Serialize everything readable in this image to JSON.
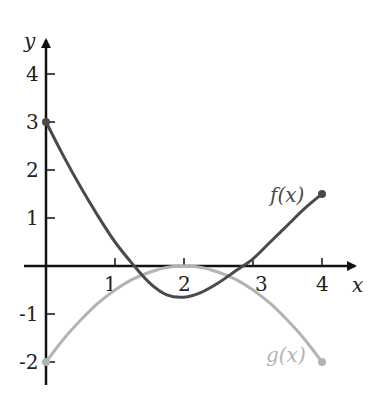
{
  "chart_data": {
    "type": "line",
    "title": "",
    "xlabel": "x",
    "ylabel": "y",
    "xlim": [
      0,
      4
    ],
    "ylim": [
      -2,
      4
    ],
    "x_ticks": [
      "1",
      "2",
      "3",
      "4"
    ],
    "y_ticks": [
      "4",
      "3",
      "2",
      "1",
      "-1",
      "-2"
    ],
    "grid": false,
    "series": [
      {
        "name": "f(x)",
        "color": "#4a4a4a",
        "x": [
          0,
          0.25,
          0.5,
          0.75,
          1,
          1.25,
          1.5,
          1.75,
          2,
          2.25,
          2.5,
          2.75,
          3,
          3.25,
          3.5,
          3.75,
          4
        ],
        "y": [
          3,
          2.3,
          1.65,
          1.05,
          0.5,
          0.05,
          -0.35,
          -0.6,
          -0.65,
          -0.55,
          -0.35,
          -0.1,
          0.15,
          0.5,
          0.85,
          1.2,
          1.5
        ]
      },
      {
        "name": "g(x)",
        "color": "#b3b3b3",
        "x": [
          0,
          0.25,
          0.5,
          0.75,
          1,
          1.25,
          1.5,
          1.75,
          2,
          2.25,
          2.5,
          2.75,
          3,
          3.25,
          3.5,
          3.75,
          4
        ],
        "y": [
          -2,
          -1.53,
          -1.13,
          -0.78,
          -0.5,
          -0.28,
          -0.13,
          -0.03,
          0,
          -0.03,
          -0.13,
          -0.28,
          -0.5,
          -0.78,
          -1.13,
          -1.53,
          -2
        ]
      }
    ],
    "annotations": [
      {
        "text": "f(x)",
        "x": 3.5,
        "y": 1.7
      },
      {
        "text": "g(x)",
        "x": 3.4,
        "y": -1.9
      }
    ]
  },
  "labels": {
    "x_axis": "x",
    "y_axis": "y",
    "f_label": "f(x)",
    "g_label": "g(x)",
    "x1": "1",
    "x2": "2",
    "x3": "3",
    "x4": "4",
    "y4": "4",
    "y3": "3",
    "y2": "2",
    "y1": "1",
    "ym1": "-1",
    "ym2": "-2"
  }
}
